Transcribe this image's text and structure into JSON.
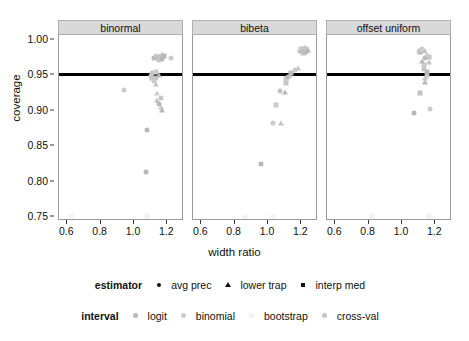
{
  "chart_data": {
    "type": "scatter",
    "title": "",
    "xlabel": "width ratio",
    "ylabel": "coverage",
    "xlim": [
      0.55,
      1.3
    ],
    "ylim": [
      0.745,
      1.005
    ],
    "xticks": [
      "0.6",
      "0.8",
      "1.0",
      "1.2"
    ],
    "xtick_values": [
      0.6,
      0.8,
      1.0,
      1.2
    ],
    "yticks": [
      "0.75",
      "0.80",
      "0.85",
      "0.90",
      "0.95",
      "1.00"
    ],
    "ytick_values": [
      0.75,
      0.8,
      0.85,
      0.9,
      0.95,
      1.0
    ],
    "grid": false,
    "legend_position": "bottom",
    "reference_line": {
      "y": 0.95,
      "orientation": "horizontal",
      "color": "#000000",
      "width": 3
    },
    "facets": [
      {
        "label": "binormal",
        "points": [
          {
            "x": 0.62,
            "y": 0.751,
            "estimator": "interp med",
            "interval": "bootstrap"
          },
          {
            "x": 0.94,
            "y": 0.928,
            "estimator": "avg prec",
            "interval": "binomial"
          },
          {
            "x": 1.07,
            "y": 0.813,
            "estimator": "avg prec",
            "interval": "logit"
          },
          {
            "x": 1.08,
            "y": 0.872,
            "estimator": "avg prec",
            "interval": "logit"
          },
          {
            "x": 1.08,
            "y": 0.751,
            "estimator": "interp med",
            "interval": "bootstrap"
          },
          {
            "x": 1.1,
            "y": 0.947,
            "estimator": "avg prec",
            "interval": "cross-val"
          },
          {
            "x": 1.11,
            "y": 0.945,
            "estimator": "interp med",
            "interval": "cross-val"
          },
          {
            "x": 1.12,
            "y": 0.941,
            "estimator": "avg prec",
            "interval": "binomial"
          },
          {
            "x": 1.13,
            "y": 0.936,
            "estimator": "lower trap",
            "interval": "cross-val"
          },
          {
            "x": 1.13,
            "y": 0.944,
            "estimator": "avg prec",
            "interval": "cross-val"
          },
          {
            "x": 1.14,
            "y": 0.923,
            "estimator": "lower trap",
            "interval": "binomial"
          },
          {
            "x": 1.14,
            "y": 0.913,
            "estimator": "lower trap",
            "interval": "cross-val"
          },
          {
            "x": 1.15,
            "y": 0.908,
            "estimator": "avg prec",
            "interval": "logit"
          },
          {
            "x": 1.16,
            "y": 0.904,
            "estimator": "lower trap",
            "interval": "binomial"
          },
          {
            "x": 1.16,
            "y": 0.916,
            "estimator": "avg prec",
            "interval": "cross-val"
          },
          {
            "x": 1.17,
            "y": 0.9,
            "estimator": "lower trap",
            "interval": "logit"
          },
          {
            "x": 1.12,
            "y": 0.972,
            "estimator": "avg prec",
            "interval": "logit"
          },
          {
            "x": 1.13,
            "y": 0.975,
            "estimator": "avg prec",
            "interval": "binomial"
          },
          {
            "x": 1.14,
            "y": 0.973,
            "estimator": "interp med",
            "interval": "cross-val"
          },
          {
            "x": 1.15,
            "y": 0.976,
            "estimator": "lower trap",
            "interval": "logit"
          },
          {
            "x": 1.15,
            "y": 0.97,
            "estimator": "avg prec",
            "interval": "cross-val"
          },
          {
            "x": 1.16,
            "y": 0.974,
            "estimator": "interp med",
            "interval": "binomial"
          },
          {
            "x": 1.17,
            "y": 0.978,
            "estimator": "lower trap",
            "interval": "cross-val"
          },
          {
            "x": 1.17,
            "y": 0.971,
            "estimator": "avg prec",
            "interval": "logit"
          },
          {
            "x": 1.18,
            "y": 0.975,
            "estimator": "interp med",
            "interval": "logit"
          },
          {
            "x": 1.22,
            "y": 0.972,
            "estimator": "avg prec",
            "interval": "binomial"
          },
          {
            "x": 1.11,
            "y": 0.951,
            "estimator": "avg prec",
            "interval": "cross-val"
          },
          {
            "x": 1.13,
            "y": 0.953,
            "estimator": "interp med",
            "interval": "binomial"
          },
          {
            "x": 1.15,
            "y": 0.949,
            "estimator": "lower trap",
            "interval": "logit"
          }
        ]
      },
      {
        "label": "bibeta",
        "points": [
          {
            "x": 0.86,
            "y": 0.749,
            "estimator": "interp med",
            "interval": "bootstrap"
          },
          {
            "x": 1.03,
            "y": 0.749,
            "estimator": "interp med",
            "interval": "bootstrap"
          },
          {
            "x": 0.96,
            "y": 0.824,
            "estimator": "avg prec",
            "interval": "logit"
          },
          {
            "x": 1.03,
            "y": 0.881,
            "estimator": "avg prec",
            "interval": "binomial"
          },
          {
            "x": 1.08,
            "y": 0.882,
            "estimator": "lower trap",
            "interval": "cross-val"
          },
          {
            "x": 1.05,
            "y": 0.906,
            "estimator": "interp med",
            "interval": "binomial"
          },
          {
            "x": 1.07,
            "y": 0.927,
            "estimator": "avg prec",
            "interval": "cross-val"
          },
          {
            "x": 1.1,
            "y": 0.925,
            "estimator": "lower trap",
            "interval": "logit"
          },
          {
            "x": 1.11,
            "y": 0.938,
            "estimator": "interp med",
            "interval": "cross-val"
          },
          {
            "x": 1.11,
            "y": 0.943,
            "estimator": "interp med",
            "interval": "binomial"
          },
          {
            "x": 1.12,
            "y": 0.946,
            "estimator": "avg prec",
            "interval": "logit"
          },
          {
            "x": 1.13,
            "y": 0.949,
            "estimator": "lower trap",
            "interval": "cross-val"
          },
          {
            "x": 1.14,
            "y": 0.952,
            "estimator": "interp med",
            "interval": "logit"
          },
          {
            "x": 1.16,
            "y": 0.956,
            "estimator": "avg prec",
            "interval": "binomial"
          },
          {
            "x": 1.18,
            "y": 0.958,
            "estimator": "lower trap",
            "interval": "cross-val"
          },
          {
            "x": 1.19,
            "y": 0.982,
            "estimator": "avg prec",
            "interval": "logit"
          },
          {
            "x": 1.2,
            "y": 0.985,
            "estimator": "interp med",
            "interval": "binomial"
          },
          {
            "x": 1.21,
            "y": 0.98,
            "estimator": "lower trap",
            "interval": "cross-val"
          },
          {
            "x": 1.21,
            "y": 0.986,
            "estimator": "avg prec",
            "interval": "cross-val"
          },
          {
            "x": 1.22,
            "y": 0.983,
            "estimator": "interp med",
            "interval": "logit"
          },
          {
            "x": 1.22,
            "y": 0.988,
            "estimator": "lower trap",
            "interval": "binomial"
          },
          {
            "x": 1.23,
            "y": 0.981,
            "estimator": "avg prec",
            "interval": "logit"
          },
          {
            "x": 1.23,
            "y": 0.986,
            "estimator": "interp med",
            "interval": "cross-val"
          },
          {
            "x": 1.24,
            "y": 0.984,
            "estimator": "lower trap",
            "interval": "logit"
          }
        ]
      },
      {
        "label": "offset uniform",
        "points": [
          {
            "x": 0.82,
            "y": 0.75,
            "estimator": "interp med",
            "interval": "bootstrap"
          },
          {
            "x": 1.16,
            "y": 0.75,
            "estimator": "interp med",
            "interval": "bootstrap"
          },
          {
            "x": 1.07,
            "y": 0.896,
            "estimator": "avg prec",
            "interval": "logit"
          },
          {
            "x": 1.17,
            "y": 0.901,
            "estimator": "avg prec",
            "interval": "binomial"
          },
          {
            "x": 1.11,
            "y": 0.924,
            "estimator": "interp med",
            "interval": "cross-val"
          },
          {
            "x": 1.14,
            "y": 0.939,
            "estimator": "lower trap",
            "interval": "logit"
          },
          {
            "x": 1.14,
            "y": 0.944,
            "estimator": "lower trap",
            "interval": "cross-val"
          },
          {
            "x": 1.15,
            "y": 0.948,
            "estimator": "avg prec",
            "interval": "binomial"
          },
          {
            "x": 1.15,
            "y": 0.953,
            "estimator": "interp med",
            "interval": "logit"
          },
          {
            "x": 1.13,
            "y": 0.957,
            "estimator": "avg prec",
            "interval": "cross-val"
          },
          {
            "x": 1.13,
            "y": 0.963,
            "estimator": "interp med",
            "interval": "binomial"
          },
          {
            "x": 1.12,
            "y": 0.968,
            "estimator": "lower trap",
            "interval": "logit"
          },
          {
            "x": 1.14,
            "y": 0.972,
            "estimator": "avg prec",
            "interval": "logit"
          },
          {
            "x": 1.16,
            "y": 0.974,
            "estimator": "interp med",
            "interval": "cross-val"
          },
          {
            "x": 1.15,
            "y": 0.979,
            "estimator": "lower trap",
            "interval": "binomial"
          },
          {
            "x": 1.13,
            "y": 0.982,
            "estimator": "avg prec",
            "interval": "cross-val"
          },
          {
            "x": 1.11,
            "y": 0.981,
            "estimator": "interp med",
            "interval": "logit"
          },
          {
            "x": 1.1,
            "y": 0.984,
            "estimator": "lower trap",
            "interval": "cross-val"
          },
          {
            "x": 1.12,
            "y": 0.986,
            "estimator": "avg prec",
            "interval": "binomial"
          },
          {
            "x": 1.16,
            "y": 0.967,
            "estimator": "lower trap",
            "interval": "cross-val"
          }
        ]
      }
    ]
  },
  "legends": [
    {
      "key": "estimator",
      "title": "estimator",
      "items": [
        {
          "label": "avg prec",
          "shape": "circle"
        },
        {
          "label": "lower trap",
          "shape": "triangle"
        },
        {
          "label": "interp med",
          "shape": "square"
        }
      ]
    },
    {
      "key": "interval",
      "title": "interval",
      "items": [
        {
          "label": "logit",
          "shape": "swatch",
          "color": "#b8b8b8"
        },
        {
          "label": "binomial",
          "shape": "swatch",
          "color": "#cccccc"
        },
        {
          "label": "bootstrap",
          "shape": "swatch",
          "color": "#f2f2f2"
        },
        {
          "label": "cross-val",
          "shape": "swatch",
          "color": "#c4c4c4"
        }
      ]
    }
  ],
  "colors": {
    "panel_strip_bg": "#d9d9d9",
    "panel_border": "#9a9a9a",
    "reference_line": "#000000",
    "text": "#111111",
    "point_default": "#b5b5b5"
  }
}
